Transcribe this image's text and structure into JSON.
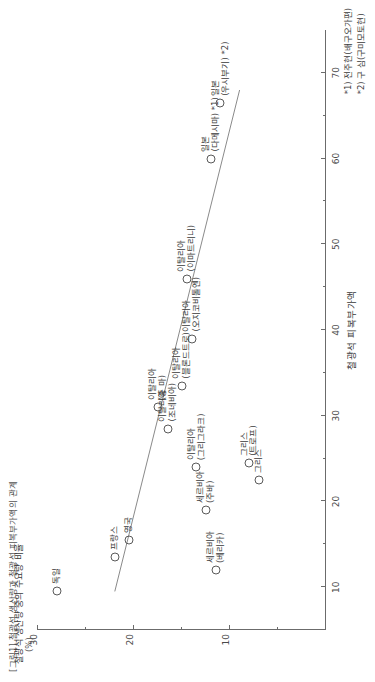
{
  "figure": {
    "caption": "[그림1] 철광석 생산량과 철광석 피복부가액의 관계",
    "unit_label": "(%)"
  },
  "chart_data": {
    "type": "scatter",
    "title": "[그림1] 철광석 생산량과 철광석 피복부가액의 관계",
    "xlabel": "철광석 피복부가액",
    "ylabel": "철광석 생산량 중의 수요량 비율",
    "yunit": "(%)",
    "xlim": [
      5,
      75
    ],
    "ylim": [
      0,
      30
    ],
    "xticks": [
      10,
      20,
      30,
      40,
      50,
      60,
      70
    ],
    "xminor": [
      15,
      25,
      35,
      45,
      55,
      65
    ],
    "yticks": [
      10,
      20,
      30
    ],
    "yminor": [
      5,
      15,
      25
    ],
    "grid": false,
    "legend": null,
    "points": [
      {
        "label": "독일",
        "x": 9.5,
        "y": 28.0,
        "label_pos": "right"
      },
      {
        "label": "프랑스",
        "x": 13.5,
        "y": 22.0,
        "label_pos": "right"
      },
      {
        "label": "영국",
        "x": 15.5,
        "y": 20.5,
        "label_pos": "right"
      },
      {
        "label": "세르비아\n(베리카)",
        "x": 12.0,
        "y": 11.5,
        "label_pos": "right"
      },
      {
        "label": "세르비아\n(주바)",
        "x": 19.0,
        "y": 12.5,
        "label_pos": "right"
      },
      {
        "label": "그리스",
        "x": 22.5,
        "y": 7.0,
        "label_pos": "right"
      },
      {
        "label": "그리스\n(트로프)",
        "x": 24.5,
        "y": 8.0,
        "label_pos": "right"
      },
      {
        "label": "이탈리아\n(그리그라크)",
        "x": 24.0,
        "y": 13.5,
        "label_pos": "right"
      },
      {
        "label": "이탈리아\n(조네비아)",
        "x": 28.5,
        "y": 16.5,
        "label_pos": "right"
      },
      {
        "label": "이탈리아\n(중 마)",
        "x": 31.0,
        "y": 17.5,
        "label_pos": "right"
      },
      {
        "label": "이탈리아\n(블론드트로)",
        "x": 33.5,
        "y": 15.0,
        "label_pos": "right"
      },
      {
        "label": "이탈리아\n(오지코비톨엔)",
        "x": 39.0,
        "y": 14.0,
        "label_pos": "right"
      },
      {
        "label": "이탈리아\n(이마트리니)",
        "x": 46.0,
        "y": 14.5,
        "label_pos": "right"
      },
      {
        "label": "일본\n(다메시마) *1)",
        "x": 60.0,
        "y": 12.0,
        "label_pos": "right"
      },
      {
        "label": "일본\n(우시부기) *2)",
        "x": 66.5,
        "y": 11.0,
        "label_pos": "right"
      }
    ],
    "trendline": {
      "x1": 9.5,
      "y1": 22.0,
      "x2": 68.0,
      "y2": 9.0
    }
  },
  "notes": [
    "*1) 전주현(배구오가편)",
    "*2) 구 심(구미모토현)"
  ]
}
